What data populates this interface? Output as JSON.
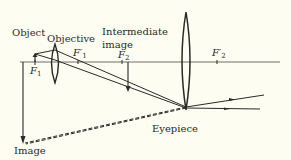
{
  "diagram": {
    "colors": {
      "background": "#fdfdf2",
      "line": "#2a2a2a",
      "axis": "#6e6e68",
      "text": "#2a2a2a"
    },
    "labels": {
      "object": "Object",
      "objective": "Objective",
      "intermediate_image_line1": "Intermediate",
      "intermediate_image_line2": "image",
      "eyepiece": "Eyepiece",
      "image": "Image"
    },
    "focal_points": {
      "f1": {
        "symbol": "F",
        "subscript": "1"
      },
      "f1_prime": {
        "symbol": "F′",
        "subscript": "1"
      },
      "f2": {
        "symbol": "F",
        "subscript": "2"
      },
      "f2_prime": {
        "symbol": "F′",
        "subscript": "2"
      }
    },
    "elements": [
      {
        "name": "optical-axis",
        "type": "line"
      },
      {
        "name": "object-arrow",
        "type": "arrow"
      },
      {
        "name": "objective-lens",
        "type": "converging-lens"
      },
      {
        "name": "intermediate-image-arrow",
        "type": "arrow"
      },
      {
        "name": "eyepiece-lens",
        "type": "converging-lens"
      },
      {
        "name": "final-virtual-image-arrow",
        "type": "arrow"
      },
      {
        "name": "refracted-rays",
        "type": "rays"
      },
      {
        "name": "virtual-ray-extensions",
        "type": "dashed-rays"
      }
    ]
  }
}
